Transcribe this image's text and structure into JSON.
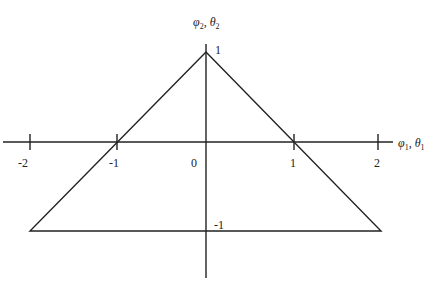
{
  "diagram": {
    "axes": {
      "x_label": {
        "sym1": "φ",
        "sub1": "1",
        "sep": ", ",
        "sym2": "θ",
        "sub2": "1"
      },
      "y_label": {
        "sym1": "φ",
        "sub1": "2",
        "sep": ", ",
        "sym2": "θ",
        "sub2": "2"
      }
    },
    "x_ticks": [
      "-2",
      "-1",
      "0",
      "1",
      "2"
    ],
    "y_ticks": {
      "top": "1",
      "bottom": "-1"
    },
    "shape": {
      "type": "triangle",
      "vertices": [
        [
          0,
          1
        ],
        [
          -2,
          -1
        ],
        [
          2,
          -1
        ]
      ]
    }
  }
}
